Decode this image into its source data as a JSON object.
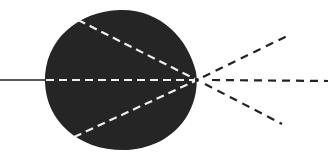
{
  "diagram": {
    "colors": {
      "background": "#ffffff",
      "body": "#252525",
      "internal_rays": "#eeeeee",
      "external_rays": "#222222"
    },
    "focal_point": {
      "x": 197,
      "y": 80
    },
    "incoming_ray": {
      "x1": 0,
      "y1": 80,
      "x2": 46,
      "y2": 80
    },
    "internal_rays": [
      {
        "x1": 78,
        "y1": 20,
        "x2": 197,
        "y2": 80
      },
      {
        "x1": 46,
        "y1": 80,
        "x2": 197,
        "y2": 80
      },
      {
        "x1": 74,
        "y1": 137,
        "x2": 197,
        "y2": 80
      }
    ],
    "external_rays": [
      {
        "x1": 197,
        "y1": 80,
        "x2": 287,
        "y2": 36
      },
      {
        "x1": 197,
        "y1": 80,
        "x2": 328,
        "y2": 81
      },
      {
        "x1": 197,
        "y1": 80,
        "x2": 282,
        "y2": 124
      }
    ]
  }
}
